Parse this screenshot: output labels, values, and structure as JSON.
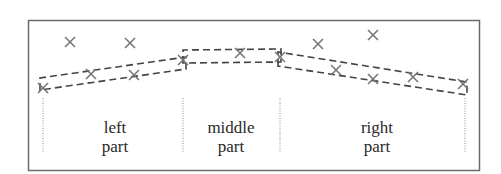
{
  "diagram": {
    "frame": {
      "x": 28,
      "y": 20,
      "w": 452,
      "h": 151,
      "color": "#6b6b6b"
    },
    "line_color": "#444444",
    "marker_color": "#777777",
    "segments": [
      {
        "name": "left",
        "label_line1": "left",
        "label_line2": "part",
        "x_start": 40,
        "x_end": 186,
        "band": {
          "upper": [
            [
              40,
              78
            ],
            [
              186,
              57
            ]
          ],
          "lower": [
            [
              40,
              90
            ],
            [
              186,
              69
            ]
          ]
        }
      },
      {
        "name": "middle",
        "label_line1": "middle",
        "label_line2": "part",
        "x_start": 183,
        "x_end": 281,
        "band": {
          "upper": [
            [
              183,
              50
            ],
            [
              281,
              49
            ]
          ],
          "lower": [
            [
              183,
              63
            ],
            [
              281,
              62
            ]
          ]
        }
      },
      {
        "name": "right",
        "label_line1": "right",
        "label_line2": "part",
        "x_start": 278,
        "x_end": 467,
        "band": {
          "upper": [
            [
              278,
              52
            ],
            [
              467,
              82
            ]
          ],
          "lower": [
            [
              278,
              66
            ],
            [
              467,
              95
            ]
          ]
        }
      }
    ],
    "boundaries_x": [
      43,
      183,
      280,
      465
    ],
    "points": [
      {
        "x": 70,
        "y": 42
      },
      {
        "x": 130,
        "y": 43
      },
      {
        "x": 43,
        "y": 88
      },
      {
        "x": 91,
        "y": 74
      },
      {
        "x": 134,
        "y": 75
      },
      {
        "x": 183,
        "y": 60
      },
      {
        "x": 240,
        "y": 53
      },
      {
        "x": 280,
        "y": 57
      },
      {
        "x": 318,
        "y": 44
      },
      {
        "x": 373,
        "y": 35
      },
      {
        "x": 336,
        "y": 70
      },
      {
        "x": 373,
        "y": 79
      },
      {
        "x": 413,
        "y": 77
      },
      {
        "x": 463,
        "y": 84
      }
    ]
  }
}
